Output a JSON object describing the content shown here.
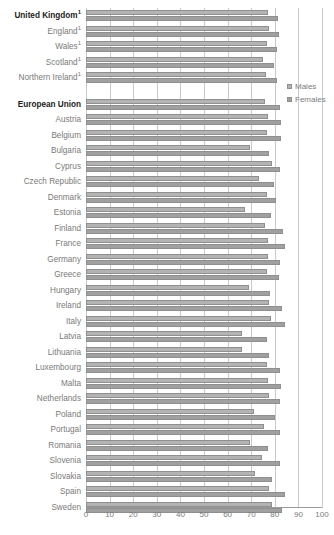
{
  "chart_data": {
    "type": "bar",
    "orientation": "horizontal",
    "title": "",
    "xlabel": "",
    "ylabel": "",
    "xlim": [
      0,
      100
    ],
    "xticks": [
      0,
      10,
      20,
      30,
      40,
      50,
      60,
      70,
      80,
      90,
      100
    ],
    "grid": true,
    "legend_position": "right",
    "legend": [
      "Males",
      "Females"
    ],
    "series": [
      {
        "name": "Males",
        "color": "#b3b3b3",
        "values": [
          77.2,
          77.4,
          76.6,
          74.8,
          76.3,
          null,
          75.8,
          77.0,
          76.6,
          69.5,
          78.8,
          73.5,
          76.5,
          67.4,
          76.0,
          77.3,
          77.2,
          76.8,
          69.2,
          77.4,
          78.5,
          66.2,
          65.9,
          76.8,
          77.3,
          77.7,
          71.3,
          75.5,
          69.5,
          74.6,
          71.4,
          77.7,
          79.0
        ]
      },
      {
        "name": "Females",
        "color": "#a0a0a0",
        "values": [
          81.5,
          81.6,
          81.0,
          79.7,
          81.0,
          null,
          82.0,
          82.8,
          82.6,
          77.4,
          82.3,
          79.7,
          80.7,
          78.2,
          83.3,
          84.4,
          82.3,
          81.8,
          77.8,
          82.9,
          84.5,
          76.5,
          77.4,
          82.2,
          82.8,
          82.3,
          80.0,
          82.3,
          77.2,
          82.3,
          78.9,
          84.3,
          83.1
        ]
      }
    ],
    "categories": [
      "United Kingdom",
      "England",
      "Wales",
      "Scotland",
      "Northern Ireland",
      "",
      "European Union",
      "Austria",
      "Belgium",
      "Bulgaria",
      "Cyprus",
      "Czech Republic",
      "Denmark",
      "Estonia",
      "Finland",
      "France",
      "Germany",
      "Greece",
      "Hungary",
      "Ireland",
      "Italy",
      "Latvia",
      "Lithuania",
      "Luxembourg",
      "Malta",
      "Netherlands",
      "Poland",
      "Portugal",
      "Romania",
      "Slovenia",
      "Slovakia",
      "Spain",
      "Sweden"
    ]
  },
  "rows": [
    {
      "label": "United Kingdom",
      "footnote": "1",
      "bold": true,
      "spacer": false,
      "males": 77.2,
      "females": 81.5
    },
    {
      "label": "England",
      "footnote": "1",
      "bold": false,
      "spacer": false,
      "males": 77.4,
      "females": 81.6
    },
    {
      "label": "Wales",
      "footnote": "1",
      "bold": false,
      "spacer": false,
      "males": 76.6,
      "females": 81.0
    },
    {
      "label": "Scotland",
      "footnote": "1",
      "bold": false,
      "spacer": false,
      "males": 74.8,
      "females": 79.7
    },
    {
      "label": "Northern Ireland",
      "footnote": "1",
      "bold": false,
      "spacer": false,
      "males": 76.3,
      "females": 81.0
    },
    {
      "label": "",
      "footnote": "",
      "bold": false,
      "spacer": true,
      "males": null,
      "females": null
    },
    {
      "label": "European Union",
      "footnote": "",
      "bold": true,
      "spacer": false,
      "males": 75.8,
      "females": 82.0
    },
    {
      "label": "Austria",
      "footnote": "",
      "bold": false,
      "spacer": false,
      "males": 77.0,
      "females": 82.8
    },
    {
      "label": "Belgium",
      "footnote": "",
      "bold": false,
      "spacer": false,
      "males": 76.6,
      "females": 82.6
    },
    {
      "label": "Bulgaria",
      "footnote": "",
      "bold": false,
      "spacer": false,
      "males": 69.5,
      "females": 77.4
    },
    {
      "label": "Cyprus",
      "footnote": "",
      "bold": false,
      "spacer": false,
      "males": 78.8,
      "females": 82.3
    },
    {
      "label": "Czech Republic",
      "footnote": "",
      "bold": false,
      "spacer": false,
      "males": 73.5,
      "females": 79.7
    },
    {
      "label": "Denmark",
      "footnote": "",
      "bold": false,
      "spacer": false,
      "males": 76.5,
      "females": 80.7
    },
    {
      "label": "Estonia",
      "footnote": "",
      "bold": false,
      "spacer": false,
      "males": 67.4,
      "females": 78.2
    },
    {
      "label": "Finland",
      "footnote": "",
      "bold": false,
      "spacer": false,
      "males": 76.0,
      "females": 83.3
    },
    {
      "label": "France",
      "footnote": "",
      "bold": false,
      "spacer": false,
      "males": 77.3,
      "females": 84.4
    },
    {
      "label": "Germany",
      "footnote": "",
      "bold": false,
      "spacer": false,
      "males": 77.2,
      "females": 82.3
    },
    {
      "label": "Greece",
      "footnote": "",
      "bold": false,
      "spacer": false,
      "males": 76.8,
      "females": 81.8
    },
    {
      "label": "Hungary",
      "footnote": "",
      "bold": false,
      "spacer": false,
      "males": 69.2,
      "females": 77.8
    },
    {
      "label": "Ireland",
      "footnote": "",
      "bold": false,
      "spacer": false,
      "males": 77.4,
      "females": 82.9
    },
    {
      "label": "Italy",
      "footnote": "",
      "bold": false,
      "spacer": false,
      "males": 78.5,
      "females": 84.5
    },
    {
      "label": "Latvia",
      "footnote": "",
      "bold": false,
      "spacer": false,
      "males": 66.2,
      "females": 76.5
    },
    {
      "label": "Lithuania",
      "footnote": "",
      "bold": false,
      "spacer": false,
      "males": 65.9,
      "females": 77.4
    },
    {
      "label": "Luxembourg",
      "footnote": "",
      "bold": false,
      "spacer": false,
      "males": 76.8,
      "females": 82.2
    },
    {
      "label": "Malta",
      "footnote": "",
      "bold": false,
      "spacer": false,
      "males": 77.3,
      "females": 82.8
    },
    {
      "label": "Netherlands",
      "footnote": "",
      "bold": false,
      "spacer": false,
      "males": 77.7,
      "females": 82.3
    },
    {
      "label": "Poland",
      "footnote": "",
      "bold": false,
      "spacer": false,
      "males": 71.3,
      "females": 80.0
    },
    {
      "label": "Portugal",
      "footnote": "",
      "bold": false,
      "spacer": false,
      "males": 75.5,
      "females": 82.3
    },
    {
      "label": "Romania",
      "footnote": "",
      "bold": false,
      "spacer": false,
      "males": 69.5,
      "females": 77.2
    },
    {
      "label": "Slovenia",
      "footnote": "",
      "bold": false,
      "spacer": false,
      "males": 74.6,
      "females": 82.3
    },
    {
      "label": "Slovakia",
      "footnote": "",
      "bold": false,
      "spacer": false,
      "males": 71.4,
      "females": 78.9
    },
    {
      "label": "Spain",
      "footnote": "",
      "bold": false,
      "spacer": false,
      "males": 77.7,
      "females": 84.3
    },
    {
      "label": "Sweden",
      "footnote": "",
      "bold": false,
      "spacer": false,
      "males": 79.0,
      "females": 83.1
    }
  ],
  "axis": {
    "ticks": [
      "0",
      "10",
      "20",
      "30",
      "40",
      "50",
      "60",
      "70",
      "80",
      "90",
      "100"
    ],
    "min": 0,
    "max": 100
  },
  "legend": {
    "items": [
      {
        "label": "Males",
        "key": "males",
        "color": "#b3b3b3"
      },
      {
        "label": "Females",
        "key": "females",
        "color": "#a0a0a0"
      }
    ]
  }
}
